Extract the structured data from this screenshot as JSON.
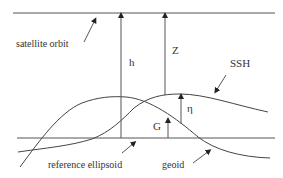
{
  "diagram": {
    "labels": {
      "satellite_orbit": "satellite orbit",
      "h": "h",
      "z": "Z",
      "ssh": "SSH",
      "eta": "η",
      "g": "G",
      "reference_ellipsoid": "reference ellipsoid",
      "geoid": "geoid"
    },
    "colors": {
      "stroke": "#444444",
      "text": "#333333",
      "background": "#ffffff"
    }
  }
}
